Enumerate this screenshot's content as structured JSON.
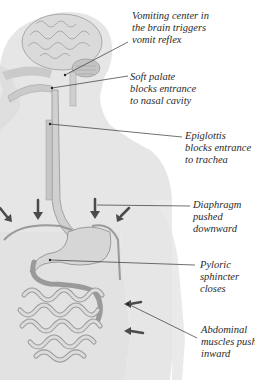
{
  "diagram": {
    "colors": {
      "silhouette": "#e4e4e4",
      "organ_fill": "#d8d8d8",
      "organ_stroke": "#8a8a8a",
      "arrow": "#4a4a4a",
      "leader_line": "#333333",
      "text": "#2a2a2a"
    },
    "labels": [
      {
        "id": "vomiting-center",
        "lines": [
          "Vomiting center in",
          "the brain triggers",
          "vomit reflex"
        ]
      },
      {
        "id": "soft-palate",
        "lines": [
          "Soft palate",
          "blocks entrance",
          "to nasal cavity"
        ]
      },
      {
        "id": "epiglottis",
        "lines": [
          "Epiglottis",
          "blocks entrance",
          "to trachea"
        ]
      },
      {
        "id": "diaphragm",
        "lines": [
          "Diaphragm",
          "pushed",
          "downward"
        ]
      },
      {
        "id": "pyloric-sphincter",
        "lines": [
          "Pyloric",
          "sphincter",
          "closes"
        ]
      },
      {
        "id": "abdominal-muscles",
        "lines": [
          "Abdominal",
          "muscles push",
          "inward"
        ]
      }
    ]
  }
}
